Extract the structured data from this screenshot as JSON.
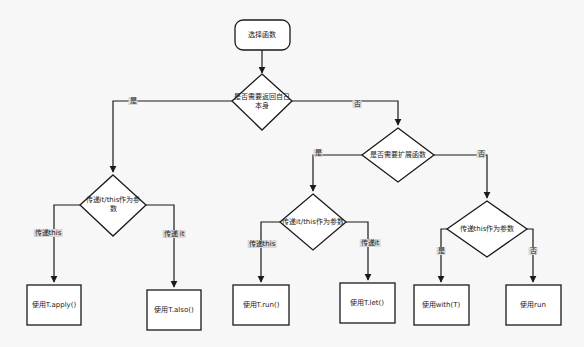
{
  "diagram": {
    "type": "flowchart",
    "colors": {
      "background": "#f7f7f7",
      "stroke": "#1a1a1a",
      "node_fill": "#ffffff",
      "edge_label_bg": "#d8d8d8",
      "text": "#222222"
    },
    "nodes": {
      "start": {
        "id": "start",
        "shape": "rounded-rect",
        "label": "选择函数"
      },
      "d_return_self": {
        "id": "d_return_self",
        "shape": "diamond",
        "label": "是否需要返回自己本身"
      },
      "d_pass_it_this_left": {
        "id": "d_pass_it_this_left",
        "shape": "diamond",
        "label": "传递it/this作为参数"
      },
      "d_extension": {
        "id": "d_extension",
        "shape": "diamond",
        "label": "是否需要扩展函数"
      },
      "d_pass_it_this_mid": {
        "id": "d_pass_it_this_mid",
        "shape": "diamond",
        "label": "传递it/this作为参数"
      },
      "d_pass_this": {
        "id": "d_pass_this",
        "shape": "diamond",
        "label": "传递this作为参数"
      },
      "r_apply": {
        "id": "r_apply",
        "shape": "rect",
        "label": "使用T.apply()"
      },
      "r_also": {
        "id": "r_also",
        "shape": "rect",
        "label": "使用T.also()"
      },
      "r_run_ext": {
        "id": "r_run_ext",
        "shape": "rect",
        "label": "使用T.run()"
      },
      "r_let": {
        "id": "r_let",
        "shape": "rect",
        "label": "使用T.let()"
      },
      "r_with": {
        "id": "r_with",
        "shape": "rect",
        "label": "使用with(T)"
      },
      "r_run": {
        "id": "r_run",
        "shape": "rect",
        "label": "使用run"
      }
    },
    "edges": [
      {
        "from": "start",
        "to": "d_return_self",
        "label": ""
      },
      {
        "from": "d_return_self",
        "to": "d_pass_it_this_left",
        "label": "是"
      },
      {
        "from": "d_return_self",
        "to": "d_extension",
        "label": "否"
      },
      {
        "from": "d_pass_it_this_left",
        "to": "r_apply",
        "label": "传递this"
      },
      {
        "from": "d_pass_it_this_left",
        "to": "r_also",
        "label": "传递 it"
      },
      {
        "from": "d_extension",
        "to": "d_pass_it_this_mid",
        "label": "是"
      },
      {
        "from": "d_extension",
        "to": "d_pass_this",
        "label": "否"
      },
      {
        "from": "d_pass_it_this_mid",
        "to": "r_run_ext",
        "label": "传递this"
      },
      {
        "from": "d_pass_it_this_mid",
        "to": "r_let",
        "label": "传递it"
      },
      {
        "from": "d_pass_this",
        "to": "r_with",
        "label": "是"
      },
      {
        "from": "d_pass_this",
        "to": "r_run",
        "label": "否"
      }
    ],
    "edge_labels": {
      "return_self_yes": "是",
      "return_self_no": "否",
      "left_pass_this": "传递this",
      "left_pass_it": "传递 it",
      "extension_yes": "是",
      "extension_no": "否",
      "mid_pass_this": "传递this",
      "mid_pass_it": "传递it",
      "pass_this_yes": "是",
      "pass_this_no": "否"
    }
  }
}
